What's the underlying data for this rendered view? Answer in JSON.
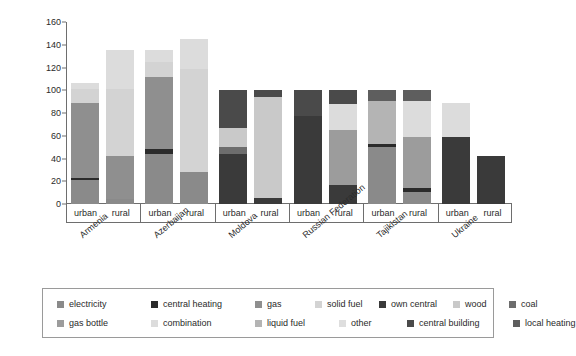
{
  "chart_data": {
    "type": "bar",
    "subtype": "stacked",
    "title": "",
    "xlabel": "",
    "ylabel": "percent values",
    "ylim": [
      0,
      160
    ],
    "yticks": [
      0,
      20,
      40,
      60,
      80,
      100,
      120,
      140,
      160
    ],
    "grid": false,
    "legend_position": "bottom",
    "groups": [
      "Armenia",
      "Azerbaijan",
      "Moldova",
      "Russian Federation",
      "Tajikistan",
      "Ukraine"
    ],
    "subcategories": [
      "urban",
      "rural"
    ],
    "categories": [
      "Armenia urban",
      "Armenia rural",
      "Azerbaijan urban",
      "Azerbaijan rural",
      "Moldova urban",
      "Moldova rural",
      "Russian Federation urban",
      "Russian Federation rural",
      "Tajikistan urban",
      "Tajikistan rural",
      "Ukraine urban",
      "Ukraine rural"
    ],
    "series": [
      {
        "name": "electricity",
        "color": "#8a8a8a",
        "values": [
          21,
          4,
          44,
          28,
          0,
          0,
          0,
          0,
          50,
          11,
          0,
          0
        ]
      },
      {
        "name": "central heating",
        "color": "#2b2b2b",
        "values": [
          2,
          0,
          4,
          0,
          0,
          0,
          0,
          0,
          3,
          3,
          0,
          0
        ]
      },
      {
        "name": "gas",
        "color": "#8f8f8f",
        "values": [
          66,
          38,
          64,
          0,
          0,
          0,
          0,
          0,
          0,
          0,
          0,
          0
        ]
      },
      {
        "name": "solid fuel",
        "color": "#d3d3d3",
        "values": [
          12,
          59,
          13,
          91,
          0,
          0,
          0,
          0,
          0,
          0,
          0,
          0
        ]
      },
      {
        "name": "own central",
        "color": "#3a3a3a",
        "values": [
          0,
          0,
          0,
          0,
          44,
          5,
          77,
          17,
          0,
          0,
          59,
          42
        ]
      },
      {
        "name": "wood",
        "color": "#c9c9c9",
        "values": [
          0,
          0,
          0,
          0,
          17,
          89,
          0,
          0,
          0,
          0,
          0,
          0
        ]
      },
      {
        "name": "coal",
        "color": "#6d6d6d",
        "values": [
          0,
          0,
          0,
          0,
          6,
          0,
          0,
          0,
          0,
          0,
          0,
          0
        ]
      },
      {
        "name": "gas bottle",
        "color": "#9c9c9c",
        "values": [
          0,
          0,
          0,
          0,
          0,
          0,
          0,
          48,
          0,
          45,
          0,
          0
        ]
      },
      {
        "name": "combination",
        "color": "#dcdcdc",
        "values": [
          5,
          34,
          10,
          26,
          0,
          0,
          0,
          23,
          0,
          32,
          30,
          0
        ]
      },
      {
        "name": "liquid fuel",
        "color": "#b4b4b4",
        "values": [
          0,
          0,
          0,
          0,
          0,
          0,
          0,
          0,
          38,
          0,
          0,
          0
        ]
      },
      {
        "name": "other",
        "color": "#dedede",
        "values": [
          0,
          0,
          0,
          0,
          0,
          0,
          0,
          0,
          0,
          0,
          0,
          0
        ]
      },
      {
        "name": "central building",
        "color": "#4a4a4a",
        "values": [
          0,
          0,
          0,
          0,
          33,
          6,
          23,
          12,
          0,
          0,
          0,
          0
        ]
      },
      {
        "name": "local heating",
        "color": "#5e5e5e",
        "values": [
          0,
          0,
          0,
          0,
          0,
          0,
          0,
          0,
          9,
          9,
          0,
          0
        ]
      }
    ],
    "totals": [
      106,
      135,
      135,
      145,
      100,
      100,
      100,
      100,
      100,
      100,
      89,
      42
    ],
    "stack_order": [
      [
        "electricity",
        "central heating",
        "gas",
        "solid fuel",
        "combination"
      ],
      [
        "electricity",
        "central heating",
        "gas",
        "solid fuel",
        "combination"
      ],
      [
        "electricity",
        "central heating",
        "gas",
        "solid fuel",
        "combination"
      ],
      [
        "electricity",
        "solid fuel",
        "combination"
      ],
      [
        "own central",
        "coal",
        "wood",
        "central building"
      ],
      [
        "own central",
        "wood",
        "central building"
      ],
      [
        "own central",
        "central building"
      ],
      [
        "own central",
        "gas bottle",
        "combination",
        "central building"
      ],
      [
        "electricity",
        "central heating",
        "liquid fuel",
        "local heating"
      ],
      [
        "electricity",
        "central heating",
        "gas bottle",
        "combination",
        "local heating"
      ],
      [
        "own central",
        "combination"
      ],
      [
        "own central"
      ]
    ]
  },
  "axis": {
    "ylabel": "percent values",
    "yticks": [
      "0",
      "20",
      "40",
      "60",
      "80",
      "100",
      "120",
      "140",
      "160"
    ]
  },
  "groups": [
    {
      "name": "Armenia"
    },
    {
      "name": "Azerbaijan"
    },
    {
      "name": "Moldova"
    },
    {
      "name": "Russian Federation"
    },
    {
      "name": "Tajikistan"
    },
    {
      "name": "Ukraine"
    }
  ],
  "subcategory_labels": [
    "urban",
    "rural",
    "urban",
    "rural",
    "urban",
    "rural",
    "urban",
    "rural",
    "urban",
    "rural",
    "urban",
    "rural"
  ],
  "legend": {
    "rows": [
      [
        {
          "label": "electricity",
          "color": "#8a8a8a"
        },
        {
          "label": "central heating",
          "color": "#2b2b2b"
        },
        {
          "label": "gas",
          "color": "#8f8f8f"
        },
        {
          "label": "solid fuel",
          "color": "#d3d3d3"
        },
        {
          "label": "own central",
          "color": "#3a3a3a"
        },
        {
          "label": "wood",
          "color": "#c9c9c9"
        },
        {
          "label": "coal",
          "color": "#6d6d6d"
        }
      ],
      [
        {
          "label": "gas bottle",
          "color": "#9c9c9c"
        },
        {
          "label": "combination",
          "color": "#dcdcdc"
        },
        {
          "label": "liquid fuel",
          "color": "#b4b4b4"
        },
        {
          "label": "other",
          "color": "#dedede"
        },
        {
          "label": "central building",
          "color": "#4a4a4a"
        },
        {
          "label": "local heating",
          "color": "#5e5e5e"
        }
      ]
    ]
  }
}
